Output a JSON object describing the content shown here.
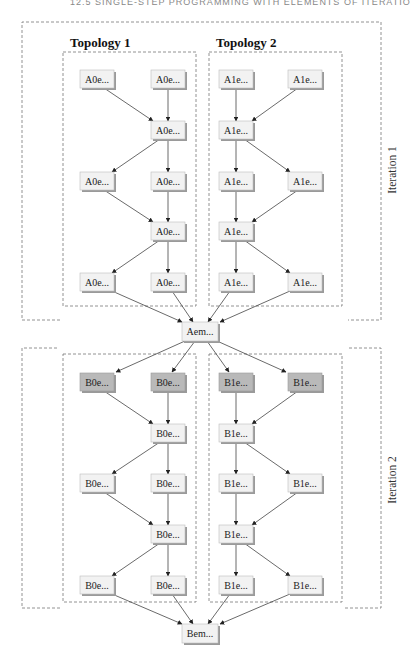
{
  "header": {
    "running_title": "12.5  SINGLE-STEP PROGRAMMING WITH ELEMENTS OF ITERATIONS"
  },
  "diagram": {
    "topology_labels": [
      "Topology 1",
      "Topology 2"
    ],
    "iteration_labels": [
      "Iteration 1",
      "Iteration 2"
    ],
    "merge_nodes": {
      "iteration1": "Aem...",
      "iteration2": "Bem..."
    },
    "iteration1": {
      "topology1": {
        "rows": [
          [
            "A0e...",
            "A0e..."
          ],
          [
            "A0e..."
          ],
          [
            "A0e...",
            "A0e..."
          ],
          [
            "A0e..."
          ],
          [
            "A0e...",
            "A0e..."
          ]
        ]
      },
      "topology2": {
        "rows": [
          [
            "A1e...",
            "A1e..."
          ],
          [
            "A1e..."
          ],
          [
            "A1e...",
            "A1e..."
          ],
          [
            "A1e..."
          ],
          [
            "A1e...",
            "A1e..."
          ]
        ]
      }
    },
    "iteration2": {
      "topology1": {
        "rows": [
          [
            "B0e...",
            "B0e..."
          ],
          [
            "B0e..."
          ],
          [
            "B0e...",
            "B0e..."
          ],
          [
            "B0e..."
          ],
          [
            "B0e...",
            "B0e..."
          ]
        ]
      },
      "topology2": {
        "rows": [
          [
            "B1e...",
            "B1e..."
          ],
          [
            "B1e..."
          ],
          [
            "B1e...",
            "B1e..."
          ],
          [
            "B1e..."
          ],
          [
            "B1e...",
            "B1e..."
          ]
        ]
      }
    },
    "colors": {
      "node_fill": "#f2f2f2",
      "node_fill_highlight": "#b9b9b9",
      "node_shadow": "#9a9a9a",
      "frame_stroke": "#777777",
      "edge_stroke": "#444444"
    }
  }
}
